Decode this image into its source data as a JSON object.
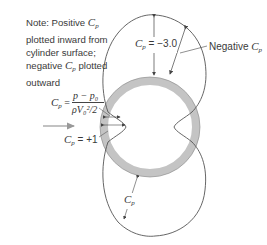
{
  "figure": {
    "note": {
      "line1_prefix": "Note: Positive ",
      "line1_symbol": "C",
      "line1_sub": "p",
      "line2": "plotted inward from",
      "line3": "cylinder surface;",
      "line4_prefix": "negative ",
      "line4_symbol": "C",
      "line4_sub": "p",
      "line4_suffix": " plotted",
      "line5": "outward"
    },
    "formula": {
      "lhs_symbol": "C",
      "lhs_sub": "p",
      "equals": " =",
      "numerator": "p − p₀",
      "denominator": "ρV₀²/2"
    },
    "labels": {
      "cp_min": {
        "symbol": "C",
        "sub": "p",
        "text": " = −3.0"
      },
      "negative": {
        "prefix": "Negative ",
        "symbol": "C",
        "sub": "p"
      },
      "cp_stag": {
        "symbol": "C",
        "sub": "p",
        "text": " = +1"
      },
      "cp_bottom": {
        "symbol": "C",
        "sub": "p"
      }
    },
    "colors": {
      "ring": "#c4c4c4",
      "curve": "#555555",
      "arrow": "#999999",
      "text": "#3a3a3a"
    }
  }
}
